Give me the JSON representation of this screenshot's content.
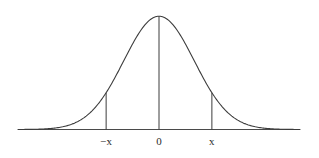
{
  "figure": {
    "name": "normal-distribution-curve",
    "background_color": "#ffffff",
    "curve_color": "#3c3c3c",
    "axis_color": "#4a4a4a",
    "label_color": "#2b2b2b"
  },
  "labels": {
    "left": "−x",
    "center": "0",
    "right": "x"
  },
  "chart_data": {
    "type": "line",
    "title": "",
    "subtitle": "",
    "xlabel": "",
    "ylabel": "",
    "grid": false,
    "legend": false,
    "legend_position": "none",
    "xlim": [
      -4,
      4
    ],
    "ylim": [
      0,
      0.42
    ],
    "axis_ticks": [
      {
        "value": -1.5,
        "label": "−x"
      },
      {
        "value": 0,
        "label": "0"
      },
      {
        "value": 1.5,
        "label": "x"
      }
    ],
    "vertical_lines": [
      {
        "x": -1.5,
        "label": "−x",
        "y_top": 0.1295
      },
      {
        "x": 0,
        "label": "0",
        "y_top": 0.3989
      },
      {
        "x": 1.5,
        "label": "x",
        "y_top": 0.1295
      }
    ],
    "series": [
      {
        "name": "standard normal density",
        "x": [
          -4,
          -3.75,
          -3.5,
          -3.25,
          -3,
          -2.75,
          -2.5,
          -2.25,
          -2,
          -1.75,
          -1.5,
          -1.25,
          -1,
          -0.75,
          -0.5,
          -0.25,
          0,
          0.25,
          0.5,
          0.75,
          1,
          1.25,
          1.5,
          1.75,
          2,
          2.25,
          2.5,
          2.75,
          3,
          3.25,
          3.5,
          3.75,
          4
        ],
        "values": [
          0.0001,
          0.0004,
          0.0009,
          0.002,
          0.0044,
          0.0091,
          0.0175,
          0.0317,
          0.054,
          0.0863,
          0.1295,
          0.1826,
          0.242,
          0.3011,
          0.3521,
          0.3867,
          0.3989,
          0.3867,
          0.3521,
          0.3011,
          0.242,
          0.1826,
          0.1295,
          0.0863,
          0.054,
          0.0317,
          0.0175,
          0.0091,
          0.0044,
          0.002,
          0.0009,
          0.0004,
          0.0001
        ]
      }
    ]
  }
}
